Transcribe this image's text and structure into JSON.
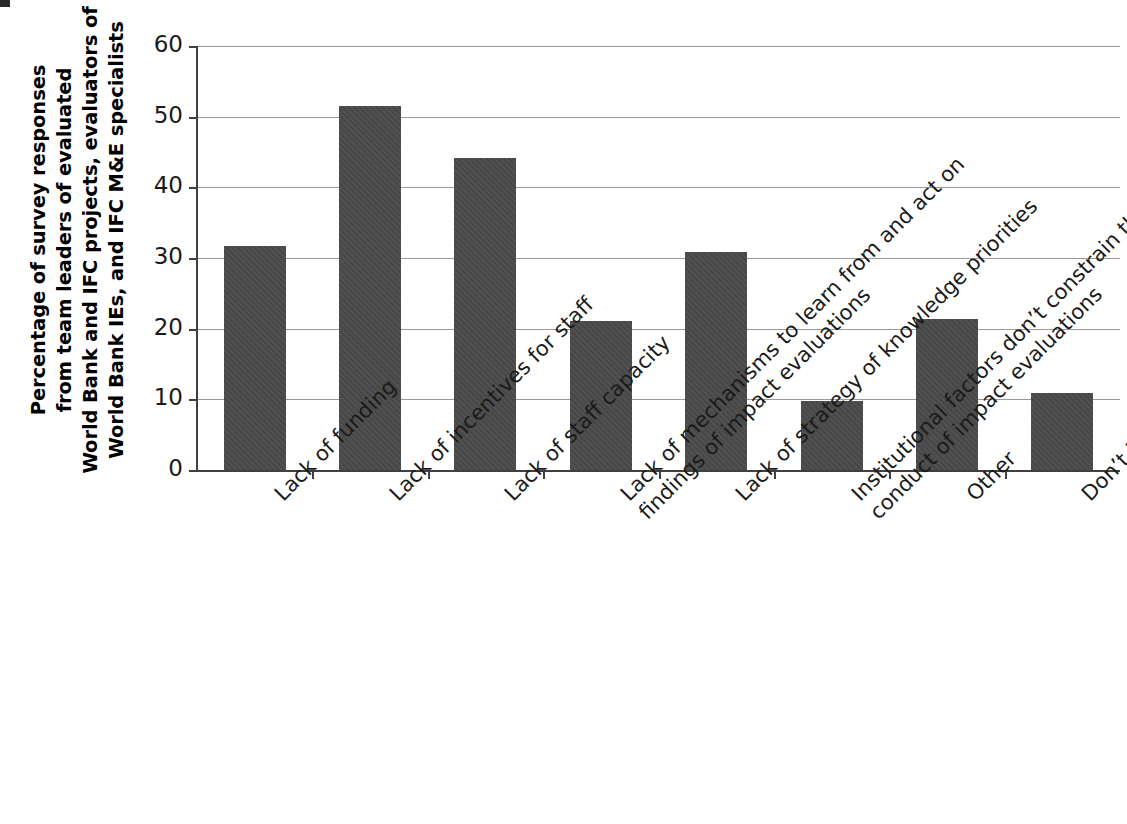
{
  "chart_data": {
    "type": "bar",
    "title": "",
    "xlabel": "",
    "ylabel": "Percentage  of survey responses from team leaders of evaluated World Bank and IFC projects, evaluators of World Bank IEs, and IFC M&E specialists",
    "ylabel_lines": [
      "Percentage  of survey responses",
      "from team leaders of evaluated",
      "World Bank and IFC projects, evaluators of",
      "World Bank IEs, and IFC M&E specialists"
    ],
    "ylim": [
      0,
      60
    ],
    "yticks": [
      0,
      10,
      20,
      30,
      40,
      50,
      60
    ],
    "ytick_labels": [
      "0",
      "10",
      "20",
      "30",
      "40",
      "50",
      "60"
    ],
    "grid": true,
    "legend": "none",
    "bar_color": "#4a4a4a",
    "axis_color": "#404040",
    "gridline_color": "#9a9a9a",
    "categories": [
      "Lack of funding",
      "Lack of incentives for staff",
      "Lack of staff capacity",
      "Lack of mechanisms to learn from and act on findings of impact evaluations",
      "Lack of strategy of knowledge priorities",
      "Institutional factors don’t constrain the conduct of impact evaluations",
      "Other",
      "Don’t know"
    ],
    "category_label_lines": [
      [
        "Lack of funding"
      ],
      [
        "Lack of incentives for staff"
      ],
      [
        "Lack of staff capacity"
      ],
      [
        "Lack of mechanisms to learn from and act on",
        "findings of impact evaluations"
      ],
      [
        "Lack of strategy of knowledge priorities"
      ],
      [
        "Institutional factors don’t constrain the",
        "conduct of impact evaluations"
      ],
      [
        "Other"
      ],
      [
        "Don’t know"
      ]
    ],
    "values": [
      31.7,
      51.5,
      44.2,
      21.1,
      30.8,
      9.8,
      21.3,
      10.9
    ]
  }
}
